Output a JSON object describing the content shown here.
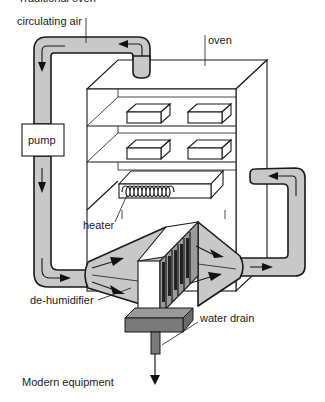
{
  "diagram": {
    "top_caption_partial": "Traditional oven",
    "caption": "Modern equipment",
    "labels": {
      "circulating_air": "circulating air",
      "oven": "oven",
      "pump": "pump",
      "heater": "heater",
      "dehumidifier": "de-humidifier",
      "water_drain": "water drain"
    },
    "colors": {
      "pipe_fill": "#c8c8c8",
      "drain_tray": "#7a7a7a",
      "outline": "#1a1a1a"
    },
    "flow": [
      "oven",
      "circulating air duct",
      "pump",
      "de-humidifier",
      "return duct",
      "oven"
    ]
  }
}
